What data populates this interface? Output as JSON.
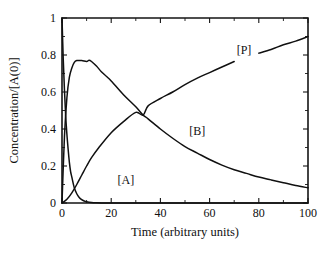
{
  "chart_data": {
    "type": "line",
    "title": "",
    "xlabel": "Time (arbitrary units)",
    "ylabel": "Concentration/[A(0)]",
    "xlim": [
      0,
      100
    ],
    "ylim": [
      0,
      1
    ],
    "grid": false,
    "legend_position": "inline-curve-labels",
    "x_ticks": [
      0,
      20,
      40,
      60,
      80,
      100
    ],
    "x_tick_labels": [
      "0",
      "20",
      "40",
      "60",
      "80",
      "100"
    ],
    "x_minor_ticks": [
      10,
      30,
      50,
      70,
      90
    ],
    "y_ticks": [
      0,
      0.2,
      0.4,
      0.6,
      0.8,
      1
    ],
    "y_tick_labels": [
      "0",
      "0.2",
      "0.4",
      "0.6",
      "0.8",
      "1"
    ],
    "y_minor_ticks": [
      0.1,
      0.3,
      0.5,
      0.7,
      0.9
    ],
    "series": [
      {
        "name": "[A]",
        "label": "[A]",
        "label_x": 26,
        "label_y": 0.12,
        "x": [
          0,
          0.5,
          1,
          1.5,
          2,
          2.5,
          3,
          3.5,
          4,
          5,
          6,
          7,
          8,
          9,
          10,
          12,
          14,
          16,
          18,
          20,
          22,
          25,
          30,
          40,
          60,
          80,
          100
        ],
        "values": [
          1.0,
          0.78,
          0.61,
          0.47,
          0.37,
          0.29,
          0.22,
          0.17,
          0.14,
          0.082,
          0.05,
          0.03,
          0.018,
          0.011,
          0.0067,
          0.0025,
          0.0009,
          0.0003,
          0.0001,
          5e-05,
          2e-05,
          0.0,
          0.0,
          0.0,
          0.0,
          0.0,
          0.0
        ]
      },
      {
        "name": "[B]",
        "label": "[B]",
        "label_x": 55,
        "label_y": 0.38,
        "x": [
          0,
          1,
          2,
          3,
          4,
          5,
          6,
          8,
          10,
          11,
          12,
          14,
          16,
          18,
          20,
          25,
          30,
          33,
          35,
          40,
          45,
          50,
          55,
          60,
          65,
          70,
          75,
          80,
          85,
          90,
          95,
          100
        ],
        "values": [
          0.0,
          0.36,
          0.57,
          0.68,
          0.73,
          0.76,
          0.77,
          0.77,
          0.765,
          0.772,
          0.765,
          0.74,
          0.71,
          0.685,
          0.66,
          0.585,
          0.52,
          0.475,
          0.455,
          0.4,
          0.35,
          0.305,
          0.27,
          0.235,
          0.205,
          0.18,
          0.16,
          0.14,
          0.125,
          0.11,
          0.095,
          0.082
        ]
      },
      {
        "name": "[P]",
        "label": "[P]",
        "label_x": 74,
        "label_y": 0.82,
        "x": [
          0,
          2,
          4,
          6,
          8,
          10,
          12,
          15,
          20,
          25,
          30,
          33,
          35,
          40,
          45,
          50,
          55,
          60,
          65,
          70,
          75,
          80,
          85,
          90,
          95,
          100
        ],
        "values": [
          0.0,
          0.02,
          0.055,
          0.1,
          0.15,
          0.2,
          0.245,
          0.3,
          0.38,
          0.44,
          0.49,
          0.475,
          0.525,
          0.565,
          0.6,
          0.64,
          0.675,
          0.705,
          0.735,
          0.765,
          0.785,
          0.81,
          0.83,
          0.855,
          0.875,
          0.9
        ]
      }
    ]
  }
}
